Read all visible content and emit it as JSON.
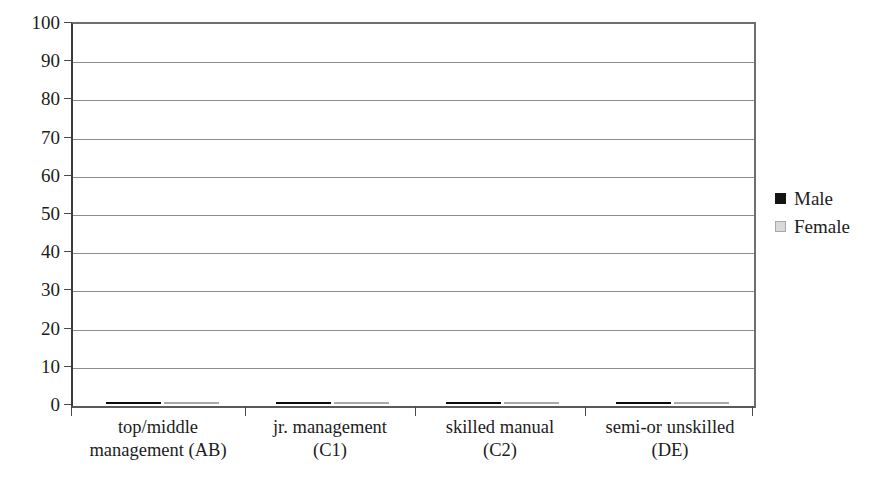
{
  "chart_data": {
    "type": "bar",
    "title": "",
    "subtitle": "",
    "xlabel": "",
    "ylabel": "",
    "ylim": [
      0,
      100
    ],
    "ytick_step": 10,
    "yticks": [
      "100",
      "90",
      "80",
      "70",
      "60",
      "50",
      "40",
      "30",
      "20",
      "10",
      "0"
    ],
    "grid": true,
    "legend_position": "right",
    "categories": [
      "top/middle management (AB)",
      "jr. management (C1)",
      "skilled manual (C2)",
      "semi-or unskilled (DE)"
    ],
    "category_lines": [
      [
        "top/middle",
        "management (AB)"
      ],
      [
        "jr. management",
        "(C1)"
      ],
      [
        "skilled manual",
        "(C2)"
      ],
      [
        "semi-or unskilled",
        "(DE)"
      ]
    ],
    "series": [
      {
        "name": "Male",
        "color": "#0b0b0b",
        "values": [
          91,
          45,
          25.5,
          49
        ]
      },
      {
        "name": "Female",
        "color": "#d9d9d9",
        "values": [
          74,
          36.5,
          37.5,
          29
        ]
      }
    ]
  },
  "legend": {
    "items": [
      {
        "label": "Male",
        "swatch": "legend-swatch-male"
      },
      {
        "label": "Female",
        "swatch": "legend-swatch-female"
      }
    ]
  },
  "colors": {
    "male_bar": "#0b0b0b",
    "female_bar": "#d9d9d9",
    "gridline": "#8d8d8d",
    "axis": "#4a4a4a",
    "text": "#1c1c1c",
    "background": "#ffffff"
  }
}
